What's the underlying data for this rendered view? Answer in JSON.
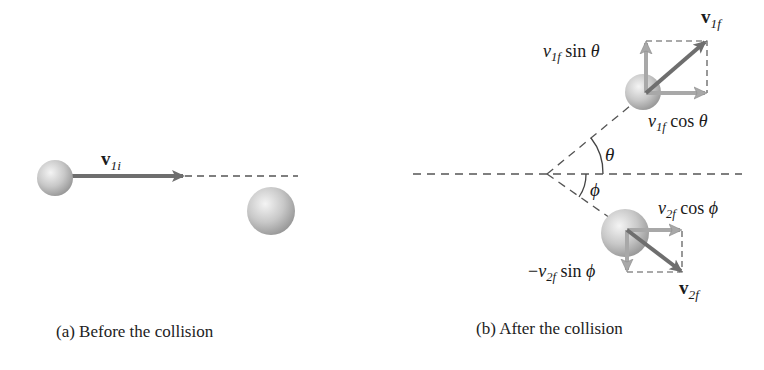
{
  "panels": [
    {
      "id": "a",
      "caption": "(a) Before the collision",
      "vector_label": {
        "base": "v",
        "sub": "1i"
      }
    },
    {
      "id": "b",
      "caption": "(b) After the collision",
      "labels": {
        "v1f": {
          "base": "v",
          "sub": "1f"
        },
        "v1f_sin": {
          "base": "v",
          "sub": "1f",
          "func": "sin",
          "angle": "θ"
        },
        "v1f_cos": {
          "base": "v",
          "sub": "1f",
          "func": "cos",
          "angle": "θ"
        },
        "theta": "θ",
        "phi": "ϕ",
        "v2f_cos": {
          "base": "v",
          "sub": "2f",
          "func": "cos",
          "angle": "ϕ"
        },
        "v2f_sin": {
          "prefix": "−",
          "base": "v",
          "sub": "2f",
          "func": "sin",
          "angle": "ϕ"
        },
        "v2f": {
          "base": "v",
          "sub": "2f"
        }
      }
    }
  ],
  "colors": {
    "arrow_dark": "#6e6e6e",
    "arrow_light": "#a8a8a8",
    "dash": "#555555",
    "ball_light": "#f2f2f2",
    "ball_dark": "#9a9a9a"
  }
}
